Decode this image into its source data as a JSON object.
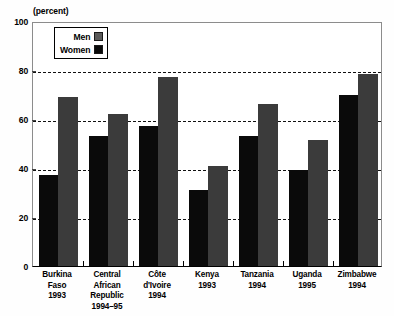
{
  "chart_data": {
    "type": "bar",
    "title": "",
    "subtitle": "",
    "unit_label": "(percent)",
    "xlabel": "",
    "ylabel": "",
    "ylim": [
      0,
      100
    ],
    "ytick_values": [
      0,
      20,
      40,
      60,
      80,
      100
    ],
    "ytick_labels": [
      "0",
      "20",
      "40",
      "60",
      "80",
      "100"
    ],
    "grid": true,
    "grid_axis": "y",
    "grid_style": "dashed",
    "legend_position": "upper-left-inside",
    "categories": [
      "Burkina Faso 1993",
      "Central African Republic 1994–95",
      "Côte d'Ivoire 1994",
      "Kenya 1993",
      "Tanzania 1994",
      "Uganda 1995",
      "Zimbabwe 1994"
    ],
    "category_lines": [
      [
        "Burkina",
        "Faso",
        "1993"
      ],
      [
        "Central",
        "African",
        "Republic",
        "1994–95"
      ],
      [
        "Côte",
        "d'Ivoire",
        "1994"
      ],
      [
        "Kenya",
        "1993"
      ],
      [
        "Tanzania",
        "1994"
      ],
      [
        "Uganda",
        "1995"
      ],
      [
        "Zimbabwe",
        "1994"
      ]
    ],
    "series": [
      {
        "name": "Men",
        "color": "#0a0a0a",
        "values": [
          37,
          53,
          57,
          31,
          53,
          39,
          70
        ]
      },
      {
        "name": "Women",
        "color": "#3b3b3b",
        "values": [
          69,
          62,
          77,
          41,
          66,
          51.5,
          78.5
        ]
      }
    ]
  },
  "legend": {
    "men_label": "Men",
    "women_label": "Women"
  },
  "axis": {
    "unit": "(percent)",
    "y_labels": [
      "100",
      "80",
      "60",
      "40",
      "20",
      "0"
    ]
  }
}
